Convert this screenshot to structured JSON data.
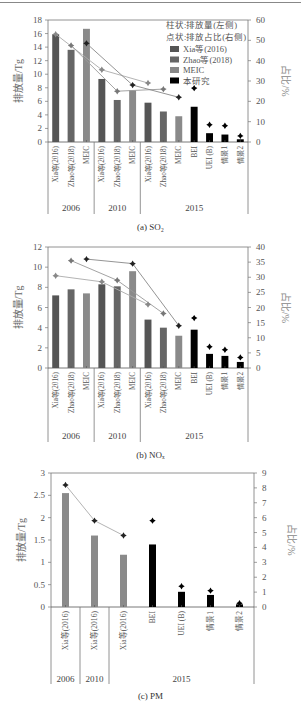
{
  "figure": {
    "captions": [
      "(a) SO₂",
      "(b) NOₓ",
      "(c) PM"
    ]
  },
  "legend": {
    "line1": "柱状:排放量(左侧)",
    "line2": "点状:排放占比(右侧)",
    "items": [
      {
        "label": "Xia等(2016)",
        "color": "#555555"
      },
      {
        "label": "Zhao等(2018)",
        "color": "#666666"
      },
      {
        "label": "MEIC",
        "color": "#888888"
      },
      {
        "label": "本研究",
        "color": "#000000"
      }
    ]
  },
  "axis_labels": {
    "left": "排放量/Tg",
    "right": "占比/%"
  },
  "chart_data": [
    {
      "type": "bar",
      "title": "(a) SO2",
      "ylabel": "排放量/Tg",
      "y2label": "占比/%",
      "ylim": [
        0,
        18
      ],
      "y2lim": [
        0,
        60
      ],
      "yticks": [
        0,
        2,
        4,
        6,
        8,
        10,
        12,
        14,
        16,
        18
      ],
      "y2ticks": [
        0,
        10,
        20,
        30,
        40,
        50,
        60
      ],
      "groups": [
        {
          "year": "2006",
          "span": 3
        },
        {
          "year": "2010",
          "span": 3
        },
        {
          "year": "2015",
          "span": 7
        }
      ],
      "categories": [
        "Xia等(2016)",
        "Zhao等(2018)",
        "MEIC",
        "Xia等(2016)",
        "Zhao等(2018)",
        "MEIC",
        "Xia等(2016)",
        "Zhao等(2018)",
        "MEIC",
        "BEI",
        "UEI (B)",
        "情景1",
        "情景2"
      ],
      "sources": [
        "Xia",
        "Zhao",
        "MEIC",
        "Xia",
        "Zhao",
        "MEIC",
        "Xia",
        "Zhao",
        "MEIC",
        "This",
        "This",
        "This",
        "This"
      ],
      "values": [
        15.9,
        13.6,
        16.7,
        9.3,
        6.2,
        7.6,
        5.8,
        4.5,
        3.8,
        5.2,
        1.3,
        1.1,
        0.4
      ],
      "share_pct": [
        53,
        47.5,
        48.5,
        35.5,
        25,
        28,
        29,
        26,
        22,
        26.5,
        8.5,
        8,
        3
      ],
      "lines": [
        {
          "series": "Xia",
          "points": [
            0,
            3,
            6
          ]
        },
        {
          "series": "Zhao",
          "points": [
            1,
            4,
            7
          ]
        },
        {
          "series": "MEIC",
          "points": [
            2,
            5,
            8
          ]
        }
      ]
    },
    {
      "type": "bar",
      "title": "(b) NOx",
      "ylabel": "排放量/Tg",
      "y2label": "占比/%",
      "ylim": [
        0,
        12
      ],
      "y2lim": [
        0,
        40
      ],
      "yticks": [
        0,
        2,
        4,
        6,
        8,
        10,
        12
      ],
      "y2ticks": [
        0,
        5,
        10,
        15,
        20,
        25,
        30,
        35,
        40
      ],
      "groups": [
        {
          "year": "2006",
          "span": 3
        },
        {
          "year": "2010",
          "span": 3
        },
        {
          "year": "2015",
          "span": 7
        }
      ],
      "categories": [
        "Xia等(2016)",
        "Zhao等(2018)",
        "MEIC",
        "Xia等(2016)",
        "Zhao等(2018)",
        "MEIC",
        "Xia等(2016)",
        "Zhao等(2018)",
        "MEIC",
        "BEI",
        "UEI (B)",
        "情景1",
        "情景2"
      ],
      "sources": [
        "Xia",
        "Zhao",
        "MEIC",
        "Xia",
        "Zhao",
        "MEIC",
        "Xia",
        "Zhao",
        "MEIC",
        "This",
        "This",
        "This",
        "This"
      ],
      "values": [
        7.2,
        7.8,
        7.4,
        8.3,
        8.1,
        9.6,
        4.8,
        4.0,
        3.2,
        3.8,
        1.4,
        1.2,
        0.6
      ],
      "share_pct": [
        30.5,
        35.5,
        36,
        28.5,
        29,
        34.5,
        21,
        18,
        14,
        16.5,
        7,
        6,
        3.5
      ],
      "lines": [
        {
          "series": "Xia",
          "points": [
            0,
            3,
            6
          ]
        },
        {
          "series": "Zhao",
          "points": [
            1,
            4,
            7
          ]
        },
        {
          "series": "MEIC",
          "points": [
            2,
            5,
            8
          ]
        }
      ]
    },
    {
      "type": "bar",
      "title": "(c) PM",
      "ylabel": "排放量/Tg",
      "y2label": "占比/%",
      "ylim": [
        0,
        3
      ],
      "y2lim": [
        0,
        9
      ],
      "yticks": [
        0,
        0.5,
        1,
        1.5,
        2,
        2.5,
        3
      ],
      "y2ticks": [
        0,
        1,
        2,
        3,
        4,
        5,
        6,
        7,
        8,
        9
      ],
      "groups": [
        {
          "year": "2006",
          "span": 1
        },
        {
          "year": "2010",
          "span": 1
        },
        {
          "year": "2015",
          "span": 5
        }
      ],
      "categories": [
        "Xia等(2016)",
        "Xia等(2016)",
        "Xia等(2016)",
        "BEI",
        "UEI (B)",
        "情景1",
        "情景2"
      ],
      "sources": [
        "MEIC",
        "MEIC",
        "MEIC",
        "This",
        "This",
        "This",
        "This"
      ],
      "values": [
        2.55,
        1.6,
        1.17,
        1.4,
        0.34,
        0.27,
        0.06
      ],
      "share_pct": [
        8.2,
        5.8,
        4.8,
        5.8,
        1.4,
        1.1,
        0.25
      ],
      "lines": [
        {
          "series": "Xia",
          "points": [
            0,
            1,
            2
          ]
        }
      ]
    }
  ]
}
